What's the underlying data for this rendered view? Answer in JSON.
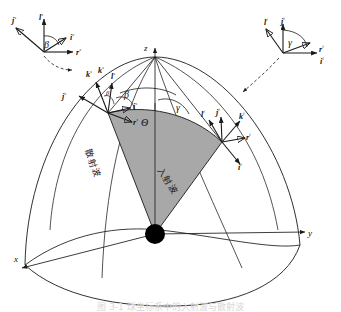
{
  "figure": {
    "kind": "scattering-geometry-diagram",
    "background": "#ffffff",
    "line_color": "#1a1a1a",
    "wedge_fill": "#a8a8a8",
    "origin_dot_color": "#000000",
    "caption": "图 3-1 球坐标系中的入射波与散射波"
  },
  "axes": {
    "z": "z",
    "x": "x",
    "y": "y"
  },
  "angles": {
    "theta": "Θ",
    "beta_inset": "β",
    "beta_sphere": "β",
    "beta_small": "β",
    "gamma_inset": "γ",
    "gamma_sphere": "γ"
  },
  "regions": {
    "scattered_wave": "散射波",
    "incident_wave": "入射波"
  },
  "scattered_frame": {
    "label_l": "l",
    "label_j": "j",
    "label_k": "k",
    "label_i": "i",
    "label_r": "r",
    "superscript": "s"
  },
  "incident_frame": {
    "label_l": "l",
    "label_j": "j",
    "label_k": "k",
    "label_i": "i",
    "label_r": "r",
    "superscript": "i"
  },
  "inset_scattered": {
    "title_vectors": [
      "j",
      "l",
      "i",
      "r",
      "k"
    ],
    "superscript": "s",
    "angle": "β"
  },
  "inset_incident": {
    "title_vectors": [
      "l",
      "j",
      "r",
      "i"
    ],
    "superscript": "i",
    "angle": "γ"
  }
}
